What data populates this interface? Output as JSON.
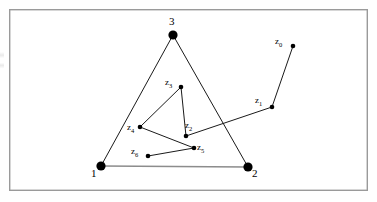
{
  "figure": {
    "title": "",
    "canvas": {
      "width": 377,
      "height": 202,
      "background": "#ffffff"
    },
    "frame": {
      "name": "figure-border",
      "x": 9,
      "y": 9,
      "width": 359,
      "height": 182,
      "stroke": "#9a9a9a",
      "stroke_width": 1.4
    },
    "styles": {
      "node_fill": "#000000",
      "edge_stroke": "#1a1a1a",
      "base_edge_stroke": "#8c8c8c",
      "edge_width": 1.0,
      "base_edge_width": 1.6
    },
    "vertices": [
      {
        "id": "v1",
        "label": "1",
        "x": 101,
        "y": 166,
        "r": 4.6,
        "label_x": 91,
        "label_y": 168
      },
      {
        "id": "v2",
        "label": "2",
        "x": 248,
        "y": 167,
        "r": 4.6,
        "label_x": 252,
        "label_y": 168
      },
      {
        "id": "v3",
        "label": "3",
        "x": 173,
        "y": 35,
        "r": 4.6,
        "label_x": 169,
        "label_y": 16
      }
    ],
    "points": [
      {
        "id": "z0",
        "label": "z",
        "sub": "0",
        "x": 293,
        "y": 46,
        "r": 2.3,
        "label_x": 275,
        "label_y": 37
      },
      {
        "id": "z1",
        "label": "z",
        "sub": "1",
        "x": 272,
        "y": 107,
        "r": 2.3,
        "label_x": 255,
        "label_y": 96
      },
      {
        "id": "z2",
        "label": "z",
        "sub": "2",
        "x": 186,
        "y": 136,
        "r": 2.3,
        "label_x": 185,
        "label_y": 121
      },
      {
        "id": "z3",
        "label": "z",
        "sub": "3",
        "x": 181,
        "y": 87,
        "r": 2.3,
        "label_x": 165,
        "label_y": 78
      },
      {
        "id": "z4",
        "label": "z",
        "sub": "4",
        "x": 140,
        "y": 127,
        "r": 2.3,
        "label_x": 127,
        "label_y": 123
      },
      {
        "id": "z5",
        "label": "z",
        "sub": "5",
        "x": 194,
        "y": 148,
        "r": 2.3,
        "label_x": 197,
        "label_y": 143
      },
      {
        "id": "z6",
        "label": "z",
        "sub": "6",
        "x": 148,
        "y": 156,
        "r": 2.3,
        "label_x": 131,
        "label_y": 147
      }
    ],
    "edges": [
      {
        "id": "e-v1-v3",
        "from": "v1",
        "to": "v3",
        "kind": "triangle"
      },
      {
        "id": "e-v3-v2",
        "from": "v3",
        "to": "v2",
        "kind": "triangle"
      },
      {
        "id": "e-v1-v2",
        "from": "v1",
        "to": "v2",
        "kind": "base"
      },
      {
        "id": "e-z0-z1",
        "from": "z0",
        "to": "z1",
        "kind": "path"
      },
      {
        "id": "e-z1-z2",
        "from": "z1",
        "to": "z2",
        "kind": "path"
      },
      {
        "id": "e-z2-z3",
        "from": "z2",
        "to": "z3",
        "kind": "path"
      },
      {
        "id": "e-z3-z4",
        "from": "z3",
        "to": "z4",
        "kind": "path"
      },
      {
        "id": "e-z4-z5",
        "from": "z4",
        "to": "z5",
        "kind": "path"
      },
      {
        "id": "e-z5-z6",
        "from": "z5",
        "to": "z6",
        "kind": "path"
      }
    ]
  },
  "chart_data": {
    "type": "scatter",
    "title": "",
    "xlabel": "",
    "ylabel": "",
    "series": [
      {
        "name": "triangle-vertices",
        "labels": [
          "1",
          "2",
          "3"
        ],
        "x": [
          101,
          248,
          173
        ],
        "y": [
          166,
          167,
          35
        ]
      },
      {
        "name": "iterate-path",
        "labels": [
          "z0",
          "z1",
          "z2",
          "z3",
          "z4",
          "z5",
          "z6"
        ],
        "x": [
          293,
          272,
          186,
          181,
          140,
          194,
          148
        ],
        "y": [
          46,
          107,
          136,
          87,
          127,
          148,
          156
        ]
      }
    ],
    "legend": "none",
    "grid": false
  }
}
